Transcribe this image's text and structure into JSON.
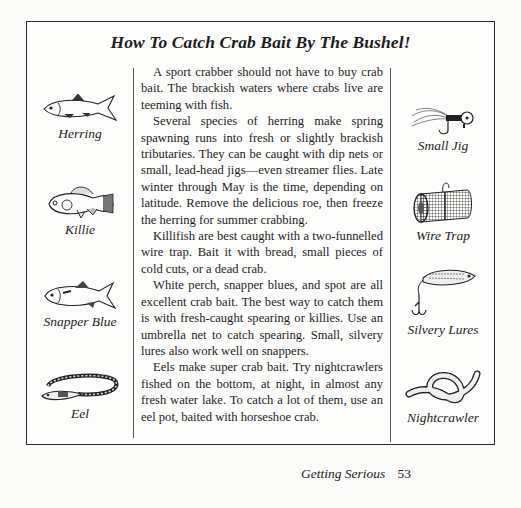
{
  "title": "How To Catch Crab Bait By The Bushel!",
  "paragraphs": [
    "A sport crabber should not have to buy crab bait. The brackish waters where crabs live are teeming with fish.",
    "Several species of herring make spring spawning runs into fresh or slightly brackish tributaries. They can be caught with dip nets or small, lead-head jigs—even streamer flies. Late winter through May is the time, depending on latitude. Remove the delicious roe, then freeze the herring for summer crabbing.",
    "Killifish are best caught with a two-funnelled wire trap. Bait it with bread, small pieces of cold cuts, or a dead crab.",
    "White perch, snapper blues, and spot are all excellent crab bait. The best way to catch them is with fresh-caught spearing or killies. Use an umbrella net to catch spearing. Small, silvery lures also work well on snappers.",
    "Eels make super crab bait. Try nightcrawlers fished on the bottom, at night, in almost any fresh water lake. To catch a lot of them, use an eel pot, baited with horseshoe crab."
  ],
  "left_illustrations": [
    {
      "caption": "Herring",
      "icon": "herring-icon"
    },
    {
      "caption": "Killie",
      "icon": "killie-icon"
    },
    {
      "caption": "Snapper Blue",
      "icon": "snapper-blue-icon"
    },
    {
      "caption": "Eel",
      "icon": "eel-icon"
    }
  ],
  "right_illustrations": [
    {
      "caption": "Small Jig",
      "icon": "small-jig-icon"
    },
    {
      "caption": "Wire Trap",
      "icon": "wire-trap-icon"
    },
    {
      "caption": "Silvery Lures",
      "icon": "silvery-lure-icon"
    },
    {
      "caption": "Nightcrawler",
      "icon": "nightcrawler-icon"
    }
  ],
  "footer": {
    "section": "Getting Serious",
    "page": "53"
  }
}
